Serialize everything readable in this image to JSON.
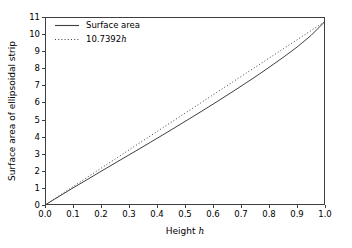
{
  "chart_data": {
    "type": "line",
    "title": "",
    "xlabel": "Height h",
    "xlabel_plain": "Height ",
    "xlabel_var": "h",
    "ylabel": "Surface area of ellipsoidal strip",
    "xlim": [
      0.0,
      1.0
    ],
    "ylim": [
      0,
      11
    ],
    "grid": false,
    "legend_position": "upper left",
    "legend_frame": false,
    "xticks": [
      "0.0",
      "0.1",
      "0.2",
      "0.3",
      "0.4",
      "0.5",
      "0.6",
      "0.7",
      "0.8",
      "0.9",
      "1.0"
    ],
    "xtick_values": [
      0.0,
      0.1,
      0.2,
      0.3,
      0.4,
      0.5,
      0.6,
      0.7,
      0.8,
      0.9,
      1.0
    ],
    "yticks": [
      "0",
      "1",
      "2",
      "3",
      "4",
      "5",
      "6",
      "7",
      "8",
      "9",
      "10",
      "11"
    ],
    "ytick_values": [
      0,
      1,
      2,
      3,
      4,
      5,
      6,
      7,
      8,
      9,
      10,
      11
    ],
    "series": [
      {
        "name": "Surface area",
        "style": "solid",
        "color": "#404040",
        "linewidth": 1.0,
        "x": [
          0.0,
          0.05,
          0.1,
          0.15,
          0.2,
          0.25,
          0.3,
          0.35,
          0.4,
          0.45,
          0.5,
          0.55,
          0.6,
          0.65,
          0.7,
          0.75,
          0.8,
          0.85,
          0.9,
          0.95,
          1.0
        ],
        "values": [
          0.0,
          0.5,
          1.0,
          1.48,
          1.97,
          2.45,
          2.93,
          3.41,
          3.9,
          4.39,
          4.89,
          5.39,
          5.9,
          6.42,
          6.95,
          7.49,
          8.05,
          8.63,
          9.24,
          9.92,
          10.74
        ]
      },
      {
        "name": "10.7392h",
        "name_plain": "10.7392",
        "name_var": "h",
        "style": "dotted",
        "color": "#404040",
        "linewidth": 1.0,
        "slope": 10.7392,
        "x": [
          0.0,
          0.1,
          0.2,
          0.3,
          0.4,
          0.5,
          0.6,
          0.7,
          0.8,
          0.9,
          1.0
        ],
        "values": [
          0.0,
          1.074,
          2.148,
          3.222,
          4.296,
          5.37,
          6.444,
          7.517,
          8.591,
          9.665,
          10.739
        ]
      }
    ]
  },
  "figure": {
    "background_color": "#ffffff",
    "axis_color": "#3f3f3f"
  }
}
